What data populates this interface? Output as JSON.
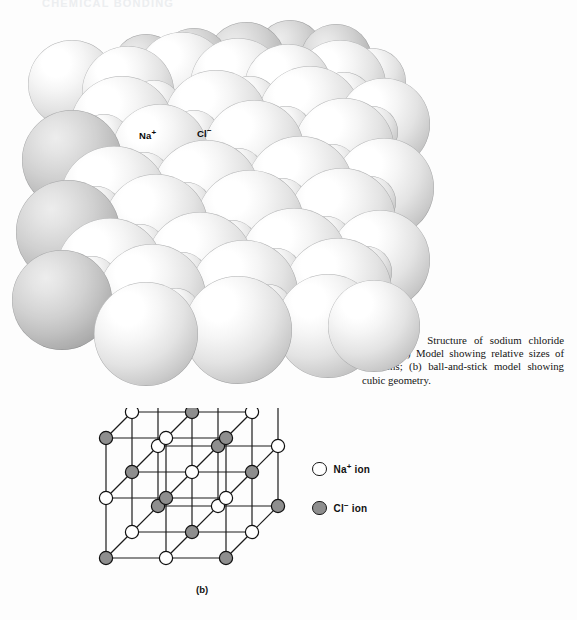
{
  "page": {
    "background_color": "#fdfdfd",
    "running_head": "CHEMICAL BONDING"
  },
  "panel_a": {
    "letter": "(a)",
    "type": "space-filling-model",
    "labels": [
      {
        "name": "sodium-ion-label",
        "symbol": "Na",
        "charge": "+",
        "x": 131,
        "y": 112
      },
      {
        "name": "chloride-ion-label",
        "symbol": "Cl",
        "charge": "−",
        "x": 189,
        "y": 110
      }
    ]
  },
  "caption": {
    "label": "Figure 9-5",
    "text": "Structure of sodium chloride crystal. (a) Model showing relative sizes of the ions; (b) ball-and-stick model showing cubic geometry."
  },
  "panel_b": {
    "letter": "(b)",
    "type": "ball-and-stick-model",
    "lattice": {
      "dimension": 3,
      "cell_pixels": 60,
      "depth_dx": 26,
      "depth_dy": -26,
      "origin_x": 36,
      "origin_y": 150,
      "node_radius": 6.6,
      "bond_color": "#1c1c1c",
      "bond_width": 1.2,
      "node_stroke": "#111111",
      "colors": {
        "sodium": "#ffffff",
        "chloride": "#8e8e8e"
      }
    }
  },
  "legend": {
    "items": [
      {
        "name": "legend-sodium",
        "swatch": "open-circle",
        "symbol": "Na",
        "charge": "+",
        "text": " ion",
        "color": "#ffffff"
      },
      {
        "name": "legend-chloride",
        "swatch": "filled-circle",
        "symbol": "Cl",
        "charge": "−",
        "text": " ion",
        "color": "#8e8e8e"
      }
    ]
  },
  "spheres_a": [
    {
      "x": 198,
      "y": 4,
      "r": 40,
      "c": "dim"
    },
    {
      "x": 248,
      "y": 2,
      "r": 34,
      "c": "dim"
    },
    {
      "x": 292,
      "y": 6,
      "r": 36,
      "c": "dim"
    },
    {
      "x": 150,
      "y": 10,
      "r": 36,
      "c": "dim"
    },
    {
      "x": 104,
      "y": 16,
      "r": 34,
      "c": "dim"
    },
    {
      "x": 20,
      "y": 22,
      "r": 44,
      "c": "bright"
    },
    {
      "x": 74,
      "y": 28,
      "r": 46,
      "c": "bright"
    },
    {
      "x": 128,
      "y": 14,
      "r": 46,
      "c": "bright"
    },
    {
      "x": 182,
      "y": 20,
      "r": 48,
      "c": "bright"
    },
    {
      "x": 236,
      "y": 26,
      "r": 44,
      "c": "bright"
    },
    {
      "x": 286,
      "y": 22,
      "r": 46,
      "c": "bright"
    },
    {
      "x": 330,
      "y": 30,
      "r": 34,
      "c": "bright"
    },
    {
      "x": 62,
      "y": 58,
      "r": 52,
      "c": "bright"
    },
    {
      "x": 118,
      "y": 62,
      "r": 28,
      "c": "bright"
    },
    {
      "x": 156,
      "y": 52,
      "r": 52,
      "c": "bright"
    },
    {
      "x": 212,
      "y": 58,
      "r": 30,
      "c": "bright"
    },
    {
      "x": 250,
      "y": 48,
      "r": 52,
      "c": "bright"
    },
    {
      "x": 306,
      "y": 54,
      "r": 30,
      "c": "bright"
    },
    {
      "x": 330,
      "y": 60,
      "r": 46,
      "c": "bright"
    },
    {
      "x": 14,
      "y": 92,
      "r": 50,
      "c": "dim"
    },
    {
      "x": 70,
      "y": 96,
      "r": 26,
      "c": "bright"
    },
    {
      "x": 104,
      "y": 86,
      "r": 48,
      "c": "bright"
    },
    {
      "x": 160,
      "y": 92,
      "r": 26,
      "c": "bright"
    },
    {
      "x": 196,
      "y": 82,
      "r": 50,
      "c": "bright"
    },
    {
      "x": 252,
      "y": 88,
      "r": 26,
      "c": "bright"
    },
    {
      "x": 286,
      "y": 80,
      "r": 50,
      "c": "bright"
    },
    {
      "x": 338,
      "y": 88,
      "r": 26,
      "c": "bright"
    },
    {
      "x": 52,
      "y": 128,
      "r": 54,
      "c": "bright"
    },
    {
      "x": 110,
      "y": 134,
      "r": 26,
      "c": "bright"
    },
    {
      "x": 144,
      "y": 122,
      "r": 54,
      "c": "bright"
    },
    {
      "x": 204,
      "y": 130,
      "r": 26,
      "c": "bright"
    },
    {
      "x": 238,
      "y": 118,
      "r": 54,
      "c": "bright"
    },
    {
      "x": 298,
      "y": 126,
      "r": 26,
      "c": "bright"
    },
    {
      "x": 326,
      "y": 120,
      "r": 50,
      "c": "bright"
    },
    {
      "x": 8,
      "y": 162,
      "r": 52,
      "c": "dim"
    },
    {
      "x": 62,
      "y": 168,
      "r": 26,
      "c": "bright"
    },
    {
      "x": 96,
      "y": 156,
      "r": 52,
      "c": "bright"
    },
    {
      "x": 152,
      "y": 164,
      "r": 26,
      "c": "bright"
    },
    {
      "x": 188,
      "y": 152,
      "r": 54,
      "c": "bright"
    },
    {
      "x": 248,
      "y": 160,
      "r": 26,
      "c": "bright"
    },
    {
      "x": 280,
      "y": 150,
      "r": 54,
      "c": "bright"
    },
    {
      "x": 336,
      "y": 158,
      "r": 26,
      "c": "bright"
    },
    {
      "x": 48,
      "y": 200,
      "r": 54,
      "c": "bright"
    },
    {
      "x": 106,
      "y": 206,
      "r": 26,
      "c": "bright"
    },
    {
      "x": 138,
      "y": 194,
      "r": 54,
      "c": "bright"
    },
    {
      "x": 198,
      "y": 202,
      "r": 26,
      "c": "bright"
    },
    {
      "x": 232,
      "y": 190,
      "r": 54,
      "c": "bright"
    },
    {
      "x": 292,
      "y": 198,
      "r": 26,
      "c": "bright"
    },
    {
      "x": 322,
      "y": 192,
      "r": 50,
      "c": "bright"
    },
    {
      "x": 4,
      "y": 232,
      "r": 50,
      "c": "dim"
    },
    {
      "x": 58,
      "y": 238,
      "r": 26,
      "c": "bright"
    },
    {
      "x": 90,
      "y": 226,
      "r": 54,
      "c": "bright"
    },
    {
      "x": 148,
      "y": 234,
      "r": 26,
      "c": "bright"
    },
    {
      "x": 182,
      "y": 222,
      "r": 54,
      "c": "bright"
    },
    {
      "x": 242,
      "y": 230,
      "r": 26,
      "c": "bright"
    },
    {
      "x": 276,
      "y": 220,
      "r": 54,
      "c": "bright"
    },
    {
      "x": 332,
      "y": 228,
      "r": 26,
      "c": "bright"
    },
    {
      "x": 86,
      "y": 264,
      "r": 52,
      "c": "bright"
    },
    {
      "x": 144,
      "y": 270,
      "r": 24,
      "c": "bright"
    },
    {
      "x": 176,
      "y": 258,
      "r": 54,
      "c": "bright"
    },
    {
      "x": 236,
      "y": 266,
      "r": 24,
      "c": "bright"
    },
    {
      "x": 268,
      "y": 256,
      "r": 52,
      "c": "bright"
    },
    {
      "x": 320,
      "y": 262,
      "r": 46,
      "c": "bright"
    }
  ]
}
